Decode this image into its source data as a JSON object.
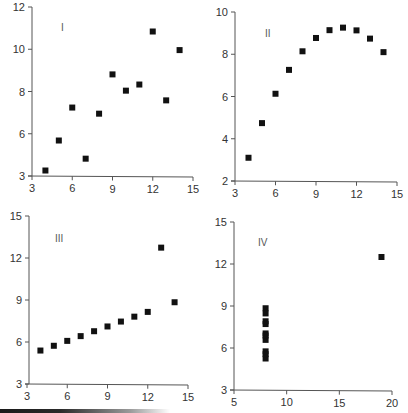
{
  "figure": {
    "accent_color": "#111111",
    "axis_color": "#555555"
  },
  "chart_data": [
    {
      "type": "scatter",
      "panel_label": "I",
      "title": "",
      "xlabel": "",
      "ylabel": "",
      "x_ticks": [
        "3",
        "6",
        "9",
        "12",
        "15"
      ],
      "y_ticks": [
        "3",
        "6",
        "8",
        "10",
        "12"
      ],
      "xlim": [
        3,
        15
      ],
      "ylim": [
        4,
        12
      ],
      "grid": false,
      "x": [
        10,
        8,
        13,
        9,
        11,
        14,
        6,
        4,
        12,
        7,
        5
      ],
      "y": [
        8.04,
        6.95,
        7.58,
        8.81,
        8.33,
        9.96,
        7.24,
        4.26,
        10.84,
        4.82,
        5.68
      ],
      "layout": {
        "x_px": [
          32,
          193
        ],
        "y_px": [
          176,
          7
        ],
        "x_tick_vals": [
          3,
          6,
          9,
          12,
          15
        ],
        "y_tick_vals": [
          4,
          6,
          8,
          10,
          12
        ],
        "axis_origin": [
          32,
          176
        ],
        "label_pos": [
          61,
          31
        ]
      }
    },
    {
      "type": "scatter",
      "panel_label": "II",
      "title": "",
      "xlabel": "",
      "ylabel": "",
      "x_ticks": [
        "3",
        "6",
        "9",
        "12",
        "15"
      ],
      "y_ticks": [
        "2",
        "4",
        "6",
        "8",
        "10"
      ],
      "xlim": [
        3,
        15
      ],
      "ylim": [
        2,
        10
      ],
      "grid": false,
      "x": [
        10,
        8,
        13,
        9,
        11,
        14,
        6,
        4,
        12,
        7,
        5
      ],
      "y": [
        9.14,
        8.14,
        8.74,
        8.77,
        9.26,
        8.1,
        6.13,
        3.1,
        9.13,
        7.26,
        4.74
      ],
      "layout": {
        "x_px": [
          235,
          397
        ],
        "y_px": [
          181,
          12
        ],
        "x_tick_vals": [
          3,
          6,
          9,
          12,
          15
        ],
        "y_tick_vals": [
          2,
          4,
          6,
          8,
          10
        ],
        "axis_origin": [
          235,
          181
        ],
        "label_pos": [
          265,
          37
        ]
      }
    },
    {
      "type": "scatter",
      "panel_label": "III",
      "title": "",
      "xlabel": "",
      "ylabel": "",
      "x_ticks": [
        "3",
        "6",
        "9",
        "12",
        "15"
      ],
      "y_ticks": [
        "3",
        "6",
        "9",
        "12",
        "15"
      ],
      "xlim": [
        3,
        15
      ],
      "ylim": [
        3,
        15
      ],
      "grid": false,
      "x": [
        10,
        8,
        13,
        9,
        11,
        14,
        6,
        4,
        12,
        7,
        5
      ],
      "y": [
        7.46,
        6.77,
        12.74,
        7.11,
        7.81,
        8.84,
        6.08,
        5.39,
        8.15,
        6.42,
        5.73
      ],
      "layout": {
        "x_px": [
          27,
          188
        ],
        "y_px": [
          384,
          216
        ],
        "x_tick_vals": [
          3,
          6,
          9,
          12,
          15
        ],
        "y_tick_vals": [
          3,
          6,
          9,
          12,
          15
        ],
        "axis_origin": [
          29,
          384
        ],
        "label_pos": [
          55,
          242
        ]
      }
    },
    {
      "type": "scatter",
      "panel_label": "IV",
      "title": "",
      "xlabel": "",
      "ylabel": "",
      "x_ticks": [
        "5",
        "10",
        "15",
        "20"
      ],
      "y_ticks": [
        "3",
        "6",
        "9",
        "12",
        "15"
      ],
      "xlim": [
        5,
        20
      ],
      "ylim": [
        3,
        15
      ],
      "grid": false,
      "x": [
        8,
        8,
        8,
        8,
        8,
        8,
        8,
        19,
        8,
        8,
        8
      ],
      "y": [
        6.58,
        5.76,
        7.71,
        8.84,
        8.47,
        7.04,
        5.25,
        12.5,
        5.56,
        7.91,
        6.89
      ],
      "layout": {
        "x_px": [
          234,
          392
        ],
        "y_px": [
          390,
          222
        ],
        "x_tick_vals": [
          5,
          10,
          15,
          20
        ],
        "y_tick_vals": [
          3,
          6,
          9,
          12,
          15
        ],
        "axis_origin": [
          234,
          390
        ],
        "label_pos": [
          258,
          246
        ]
      }
    }
  ]
}
